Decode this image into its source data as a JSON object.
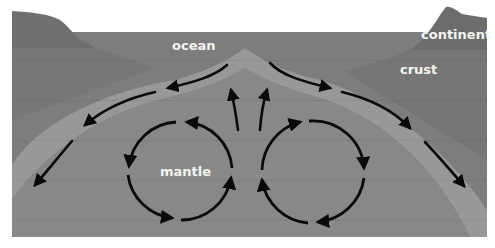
{
  "diagram": {
    "type": "cross-section",
    "labels": {
      "ocean": "ocean",
      "continent": "continent",
      "crust": "crust",
      "mantle": "mantle"
    },
    "colors": {
      "background": "#ffffff",
      "ocean": "#7d7d7d",
      "continent": "#6e6e6e",
      "crust_left": "#787878",
      "crust_right": "#7a7a7a",
      "plate_band": "#9a9a9a",
      "mantle": "#888888",
      "arrows": "#0a0a0a",
      "label_text": "#f4f4f4"
    },
    "convection_cells": [
      {
        "name": "left-cell",
        "direction": "counter-clockwise"
      },
      {
        "name": "right-cell",
        "direction": "clockwise"
      }
    ],
    "plate_motion": [
      {
        "side": "left",
        "direction": "away-from-ridge"
      },
      {
        "side": "right",
        "direction": "away-from-ridge"
      }
    ]
  }
}
